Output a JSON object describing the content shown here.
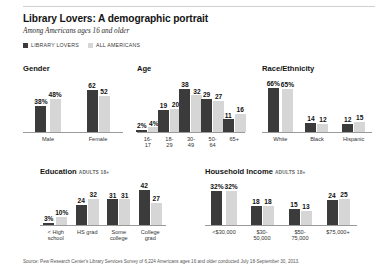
{
  "header": {
    "title": "Library Lovers: A demographic  portrait",
    "subtitle": "Among Americans ages 16 and older",
    "legend": [
      {
        "label": "LIBRARY LOVERS",
        "swatch": "dark",
        "color": "#3b3b3b"
      },
      {
        "label": "ALL AMERICANS",
        "swatch": "light",
        "color": "#d6d6d6"
      }
    ]
  },
  "source": "Source: Pew Research Center's Library Services Survey of 6,224 Americans ages 16 and older conducted July 18-September 30, 2013.",
  "chart_data": [
    {
      "id": "gender",
      "type": "bar",
      "title": "Gender",
      "note": "",
      "categories": [
        "Male",
        "Female"
      ],
      "series": [
        {
          "name": "LIBRARY LOVERS",
          "color": "#3b3b3b",
          "values": [
            38,
            62
          ],
          "labels": [
            "38%",
            "62"
          ]
        },
        {
          "name": "ALL AMERICANS",
          "color": "#d6d6d6",
          "values": [
            48,
            52
          ],
          "labels": [
            "48%",
            "52"
          ]
        }
      ],
      "ylim": [
        0,
        70
      ],
      "ylabel": "",
      "xlabel": "",
      "grid": false
    },
    {
      "id": "age",
      "type": "bar",
      "title": "Age",
      "note": "",
      "categories": [
        "16-\n17",
        "18-\n29",
        "30-\n49",
        "50-\n64",
        "65+"
      ],
      "series": [
        {
          "name": "LIBRARY LOVERS",
          "color": "#3b3b3b",
          "values": [
            2,
            19,
            38,
            29,
            11
          ],
          "labels": [
            "2%",
            "19",
            "38",
            "29",
            "11"
          ]
        },
        {
          "name": "ALL AMERICANS",
          "color": "#d6d6d6",
          "values": [
            4,
            20,
            32,
            27,
            16
          ],
          "labels": [
            "4%",
            "20",
            "32",
            "27",
            "16"
          ]
        }
      ],
      "ylim": [
        0,
        42
      ],
      "ylabel": "",
      "xlabel": "",
      "grid": false
    },
    {
      "id": "race-ethnicity",
      "type": "bar",
      "title": "Race/Ethnicity",
      "note": "",
      "categories": [
        "White",
        "Black",
        "Hispanic"
      ],
      "series": [
        {
          "name": "LIBRARY LOVERS",
          "color": "#3b3b3b",
          "values": [
            66,
            14,
            12
          ],
          "labels": [
            "66%",
            "14",
            "12"
          ]
        },
        {
          "name": "ALL AMERICANS",
          "color": "#d6d6d6",
          "values": [
            65,
            12,
            15
          ],
          "labels": [
            "65%",
            "12",
            "15"
          ]
        }
      ],
      "ylim": [
        0,
        72
      ],
      "ylabel": "",
      "xlabel": "",
      "grid": false
    },
    {
      "id": "education",
      "type": "bar",
      "title": "Education",
      "note": "ADULTS 18+",
      "categories": [
        "< High\nschool",
        "HS grad",
        "Some\ncollege",
        "College\ngrad"
      ],
      "series": [
        {
          "name": "LIBRARY LOVERS",
          "color": "#3b3b3b",
          "values": [
            3,
            24,
            31,
            42
          ],
          "labels": [
            "3%",
            "24",
            "31",
            "42"
          ]
        },
        {
          "name": "ALL AMERICANS",
          "color": "#d6d6d6",
          "values": [
            10,
            32,
            31,
            27
          ],
          "labels": [
            "10%",
            "32",
            "31",
            "27"
          ]
        }
      ],
      "ylim": [
        0,
        46
      ],
      "ylabel": "",
      "xlabel": "",
      "grid": false
    },
    {
      "id": "household-income",
      "type": "bar",
      "title": "Household Income",
      "note": "ADULTS 18+",
      "categories": [
        "<$30,000",
        "$30-\n50,000",
        "$50-\n75,000",
        "$75,000+"
      ],
      "series": [
        {
          "name": "LIBRARY LOVERS",
          "color": "#3b3b3b",
          "values": [
            32,
            18,
            15,
            24
          ],
          "labels": [
            "32%",
            "18",
            "15",
            "24"
          ]
        },
        {
          "name": "ALL AMERICANS",
          "color": "#d6d6d6",
          "values": [
            32,
            18,
            13,
            25
          ],
          "labels": [
            "32%",
            "18",
            "13",
            "25"
          ]
        }
      ],
      "ylim": [
        0,
        36
      ],
      "ylabel": "",
      "xlabel": "",
      "grid": false
    }
  ]
}
